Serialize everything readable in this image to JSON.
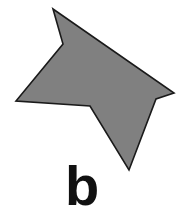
{
  "figure": {
    "label": "b",
    "shape": {
      "type": "polygon",
      "fill": "#808080",
      "stroke": "#1a1a1a",
      "points": "53,9 63,44 16,101 90,106 129,170 156,99 174,93"
    }
  }
}
